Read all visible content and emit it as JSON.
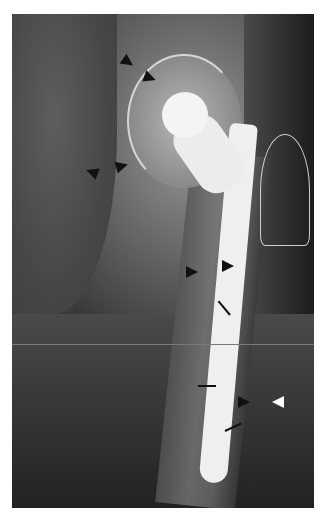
{
  "image": {
    "subject": "Hip radiograph with femoral prosthesis",
    "annotations": {
      "black_arrowheads": 8,
      "white_arrowheads": 1,
      "small_arrows": 4
    }
  }
}
